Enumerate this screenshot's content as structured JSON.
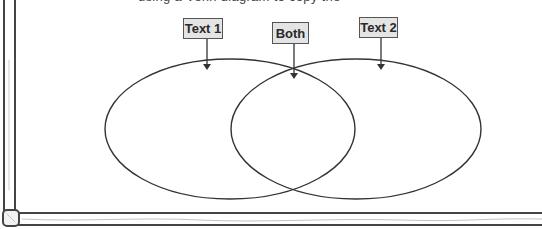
{
  "header": {
    "cutoff_instruction_text": "using a Venn diagram to copy the"
  },
  "diagram": {
    "type": "venn",
    "labels": [
      {
        "id": "text1",
        "text": "Text 1"
      },
      {
        "id": "both",
        "text": "Both"
      },
      {
        "id": "text2",
        "text": "Text 2"
      }
    ],
    "circles": [
      {
        "name": "left-set",
        "label": "Text 1",
        "cx": 230,
        "cy": 129,
        "rx": 125,
        "ry": 70
      },
      {
        "name": "right-set",
        "label": "Text 2",
        "cx": 356,
        "cy": 129,
        "rx": 125,
        "ry": 70
      }
    ],
    "colors": {
      "stroke": "#333333",
      "label_fill": "#e4e4e4",
      "label_border": "#555555",
      "frame": "#444444"
    }
  }
}
